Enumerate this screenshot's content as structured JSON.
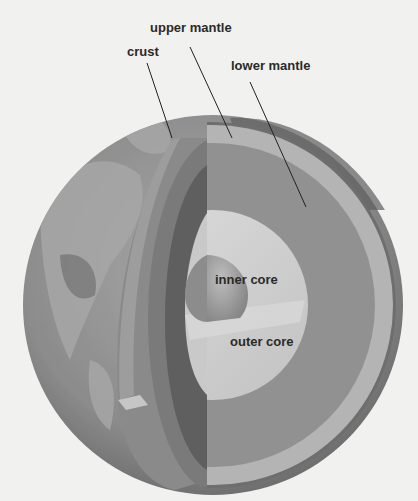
{
  "diagram": {
    "labels": {
      "upper_mantle": "upper mantle",
      "crust": "crust",
      "lower_mantle": "lower mantle",
      "inner_core": "inner core",
      "outer_core": "outer core"
    },
    "colors": {
      "background": "#f1f1f0",
      "globe_surface": "#8f8f8f",
      "globe_land": "#a9a9a9",
      "crust": "#6e6e6e",
      "upper_mantle": "#b4b4b4",
      "lower_mantle": "#909090",
      "outer_core": "#cfcfcf",
      "inner_core": "#9c9c9c",
      "leader_line": "#222222",
      "label_text": "#2a2a2a"
    }
  }
}
